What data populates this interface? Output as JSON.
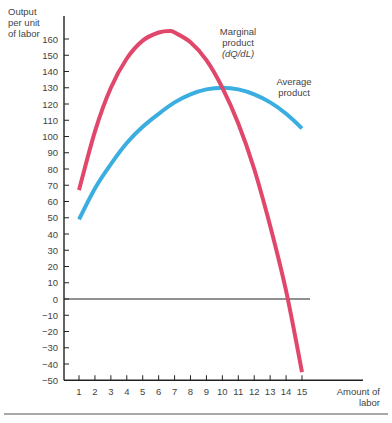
{
  "chart_data": {
    "type": "line",
    "title": "",
    "xlabel": "Amount of labor",
    "ylabel": "Output per unit of labor",
    "xlabel_lines": [
      "Amount of",
      "labor"
    ],
    "ylabel_lines": [
      "Output",
      "per unit",
      "of labor"
    ],
    "x_ticks": [
      1,
      2,
      3,
      4,
      5,
      6,
      7,
      8,
      9,
      10,
      11,
      12,
      13,
      14,
      15
    ],
    "y_ticks": [
      160,
      150,
      140,
      130,
      120,
      110,
      100,
      90,
      80,
      70,
      60,
      50,
      40,
      30,
      20,
      10,
      0,
      -10,
      -20,
      -30,
      -40,
      -50
    ],
    "xlim": [
      0,
      18.8
    ],
    "ylim": [
      -50,
      175
    ],
    "grid": false,
    "zero_line": true,
    "series": [
      {
        "name": "Marginal product (dQ/dL)",
        "label_lines": [
          "Marginal",
          "product",
          "(dQ/dL)"
        ],
        "color": "#e0476a",
        "x": [
          1,
          2,
          3,
          4,
          5,
          6,
          6.7,
          7,
          8,
          9,
          10,
          11,
          12,
          13,
          14,
          15
        ],
        "values": [
          67,
          103,
          130,
          148,
          159,
          164,
          165,
          164,
          158,
          147,
          130,
          108,
          80,
          45,
          5,
          -45
        ]
      },
      {
        "name": "Average product",
        "label_lines": [
          "Average",
          "product"
        ],
        "color": "#3aaee0",
        "x": [
          1,
          2,
          3,
          4,
          5,
          6,
          7,
          8,
          9,
          10,
          11,
          12,
          13,
          14,
          15
        ],
        "values": [
          49,
          68,
          83,
          96,
          106,
          114,
          121,
          126,
          129,
          130,
          129,
          126,
          121,
          114,
          105
        ]
      }
    ]
  }
}
